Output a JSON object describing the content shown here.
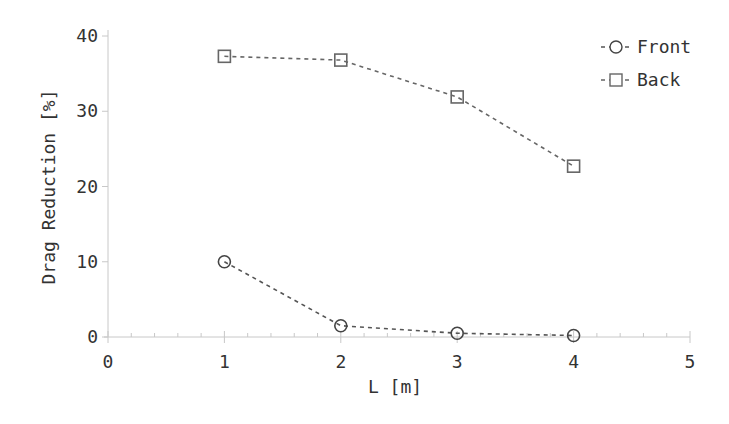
{
  "chart_data": {
    "type": "line",
    "title": "",
    "xlabel": "L [m]",
    "ylabel": "Drag Reduction [%]",
    "xlim": [
      0,
      5
    ],
    "ylim": [
      0,
      40
    ],
    "xticks": [
      "0",
      "1",
      "2",
      "3",
      "4",
      "5"
    ],
    "yticks": [
      "0",
      "10",
      "20",
      "30",
      "40"
    ],
    "grid": false,
    "legend_position": "upper right",
    "x": [
      1,
      2,
      3,
      4
    ],
    "series": [
      {
        "name": "Front",
        "marker": "circle",
        "line": "dashed",
        "color": "#555555",
        "values": [
          10.0,
          1.5,
          0.5,
          0.2
        ]
      },
      {
        "name": "Back",
        "marker": "square",
        "line": "dashed",
        "color": "#666666",
        "values": [
          37.3,
          36.8,
          31.9,
          22.7
        ]
      }
    ]
  }
}
